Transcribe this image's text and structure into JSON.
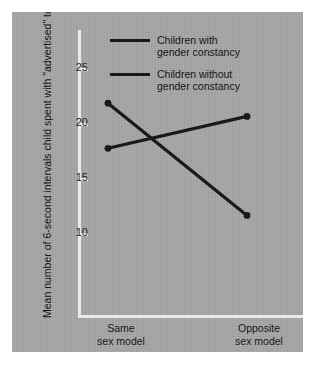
{
  "chart_data": {
    "type": "line",
    "title": "",
    "xlabel": "",
    "ylabel": "Mean number of 6-second intervals child spent with \"advertised\" toy",
    "categories": [
      "Same\nsex model",
      "Opposite\nsex model"
    ],
    "x_tick_labels": [
      "Same\nsex model",
      "Opposite\nsex model"
    ],
    "y_tick_labels": [
      "25",
      "20",
      "15",
      "10"
    ],
    "y_ticks": [
      25,
      20,
      15,
      10
    ],
    "ylim": [
      7.5,
      27.5
    ],
    "grid": false,
    "legend_position": "top-center",
    "series": [
      {
        "name": "Children with\ngender constancy",
        "values": [
          21.8,
          11.6
        ],
        "color": "#151515",
        "marker": "circle"
      },
      {
        "name": "Children without\ngender constancy",
        "values": [
          17.7,
          20.6
        ],
        "color": "#151515",
        "marker": "circle"
      }
    ]
  },
  "legend": {
    "items": [
      {
        "label": "Children with\ngender constancy"
      },
      {
        "label": "Children without\ngender constancy"
      }
    ]
  },
  "axes": {
    "y_title": "Mean number of 6-second intervals child spent with \"advertised\" toy",
    "y_ticks": [
      {
        "label": "25"
      },
      {
        "label": "20"
      },
      {
        "label": "15"
      },
      {
        "label": "10"
      }
    ],
    "x_labels": [
      {
        "line1": "Same",
        "line2": "sex model"
      },
      {
        "line1": "Opposite",
        "line2": "sex model"
      }
    ]
  },
  "colors": {
    "panel_background": "#a8a8a8",
    "page_background": "#ffffff",
    "axis": "#f2f2f2",
    "series_line": "#151515",
    "text": "#101010"
  }
}
